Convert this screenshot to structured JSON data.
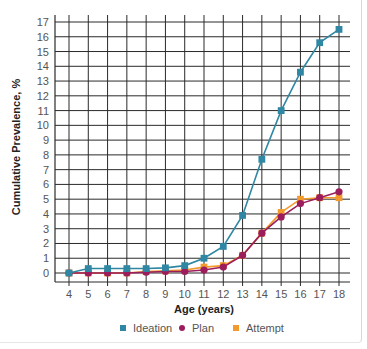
{
  "chart_data": {
    "type": "line",
    "title": "",
    "xlabel": "Age (years)",
    "ylabel": "Cumulative Prevalence, %",
    "x": [
      4,
      5,
      6,
      7,
      8,
      9,
      10,
      11,
      12,
      13,
      14,
      15,
      16,
      17,
      18
    ],
    "ylim": [
      0,
      17
    ],
    "xlim": [
      4,
      18
    ],
    "yticks": [
      0,
      1,
      2,
      3,
      4,
      5,
      6,
      7,
      8,
      9,
      10,
      11,
      12,
      13,
      14,
      15,
      16,
      17
    ],
    "grid": true,
    "legend_position": "bottom",
    "series": [
      {
        "name": "Ideation",
        "color": "#2f87a3",
        "marker": "square",
        "values": [
          0.0,
          0.3,
          0.3,
          0.3,
          0.3,
          0.35,
          0.5,
          1.0,
          1.8,
          3.9,
          7.7,
          11.0,
          13.6,
          15.6,
          16.5
        ]
      },
      {
        "name": "Plan",
        "color": "#9b1d5b",
        "marker": "circle",
        "values": [
          0.0,
          0.0,
          0.0,
          0.0,
          0.05,
          0.1,
          0.1,
          0.2,
          0.4,
          1.2,
          2.7,
          3.8,
          4.7,
          5.1,
          5.5
        ]
      },
      {
        "name": "Attempt",
        "color": "#f39a2c",
        "marker": "square",
        "values": [
          0.0,
          0.0,
          0.0,
          0.0,
          0.1,
          0.15,
          0.2,
          0.4,
          0.5,
          1.2,
          2.7,
          4.1,
          5.0,
          5.1,
          5.1
        ]
      }
    ]
  }
}
